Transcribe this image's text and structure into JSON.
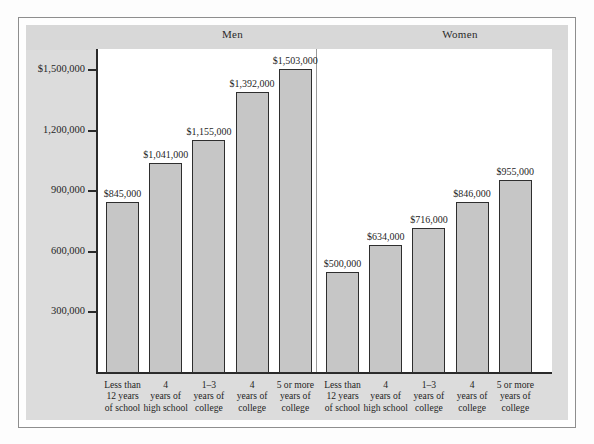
{
  "figure": {
    "background": "#dcdcdc",
    "plot_background": "#ffffff",
    "bar_fill": "#c6c6c6",
    "bar_stroke": "#2e2e2e"
  },
  "panels": [
    {
      "name": "men-panel",
      "title": "Men"
    },
    {
      "name": "women-panel",
      "title": "Women"
    }
  ],
  "axis": {
    "y_ticks": [
      {
        "label": "$1,500,000",
        "value": 1500000
      },
      {
        "label": "1,200,000",
        "value": 1200000
      },
      {
        "label": "900,000",
        "value": 900000
      },
      {
        "label": "600,000",
        "value": 600000
      },
      {
        "label": "300,000",
        "value": 300000
      }
    ]
  },
  "categories": [
    {
      "line1": "Less than",
      "line2": "12 years",
      "line3": "of school"
    },
    {
      "line1": "4",
      "line2": "years of",
      "line3": "high school"
    },
    {
      "line1": "1–3",
      "line2": "years of",
      "line3": "college"
    },
    {
      "line1": "4",
      "line2": "years of",
      "line3": "college"
    },
    {
      "line1": "5 or more",
      "line2": "years of",
      "line3": "college"
    }
  ],
  "bars": {
    "men": [
      {
        "label": "$845,000",
        "value": 845000
      },
      {
        "label": "$1,041,000",
        "value": 1041000
      },
      {
        "label": "$1,155,000",
        "value": 1155000
      },
      {
        "label": "$1,392,000",
        "value": 1392000
      },
      {
        "label": "$1,503,000",
        "value": 1503000
      }
    ],
    "women": [
      {
        "label": "$500,000",
        "value": 500000
      },
      {
        "label": "$634,000",
        "value": 634000
      },
      {
        "label": "$716,000",
        "value": 716000
      },
      {
        "label": "$846,000",
        "value": 846000
      },
      {
        "label": "$955,000",
        "value": 955000
      }
    ]
  },
  "chart_data": {
    "type": "bar",
    "title": "",
    "xlabel": "",
    "ylabel": "",
    "ylim": [
      0,
      1600000
    ],
    "grid": false,
    "legend": "none",
    "panels": [
      "Men",
      "Women"
    ],
    "categories": [
      "Less than 12 years of school",
      "4 years of high school",
      "1–3 years of college",
      "4 years of college",
      "5 or more years of college"
    ],
    "series": [
      {
        "name": "Men",
        "values": [
          845000,
          1041000,
          1155000,
          1392000,
          1503000
        ]
      },
      {
        "name": "Women",
        "values": [
          500000,
          634000,
          716000,
          846000,
          955000
        ]
      }
    ],
    "data_labels": {
      "Men": [
        "$845,000",
        "$1,041,000",
        "$1,155,000",
        "$1,392,000",
        "$1,503,000"
      ],
      "Women": [
        "$500,000",
        "$634,000",
        "$716,000",
        "$846,000",
        "$955,000"
      ]
    },
    "ytick_labels": [
      "$1,500,000",
      "1,200,000",
      "900,000",
      "600,000",
      "300,000"
    ],
    "ytick_values": [
      1500000,
      1200000,
      900000,
      600000,
      300000
    ]
  }
}
